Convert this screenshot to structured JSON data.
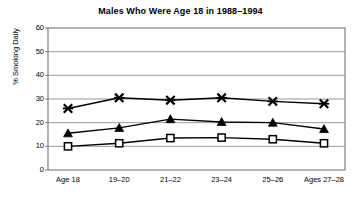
{
  "chart_data": {
    "type": "line",
    "title": "Males Who Were Age 18 in 1988–1994",
    "xlabel": "",
    "ylabel": "% Smoking Daily",
    "categories": [
      "Age 18",
      "19–20",
      "21–22",
      "23–24",
      "25–26",
      "Ages 27–28"
    ],
    "yticks": [
      0,
      10,
      20,
      30,
      40,
      50,
      60
    ],
    "ylim": [
      0,
      60
    ],
    "grid": "horizontal",
    "legend": "none",
    "series": [
      {
        "name": "x-series",
        "marker": "x-cross",
        "values": [
          26,
          30.5,
          29.5,
          30.5,
          29,
          28
        ]
      },
      {
        "name": "triangle-series",
        "marker": "filled-triangle",
        "values": [
          15.5,
          17.8,
          21.5,
          20.3,
          20,
          17.3
        ]
      },
      {
        "name": "square-series",
        "marker": "open-square",
        "values": [
          10,
          11.3,
          13.5,
          13.7,
          13,
          11.3
        ]
      }
    ],
    "colors": {
      "line": "#000000",
      "grid": "#999999",
      "axis": "#808080",
      "background": "#ffffff"
    }
  },
  "ytick_labels": [
    "60",
    "50",
    "40",
    "30",
    "20",
    "10",
    "0"
  ]
}
